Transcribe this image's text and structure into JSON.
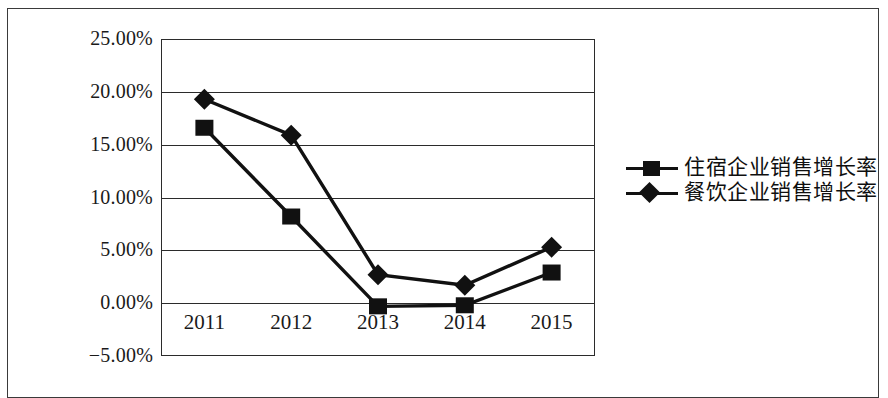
{
  "chart_data": {
    "type": "line",
    "title": "",
    "subtitle": "",
    "xlabel": "",
    "ylabel": "",
    "categories": [
      "2011",
      "2012",
      "2013",
      "2014",
      "2015"
    ],
    "ylim": [
      -5,
      25
    ],
    "yticks": [
      25,
      20,
      15,
      10,
      5,
      0,
      -5
    ],
    "ytick_labels": [
      "25.00%",
      "20.00%",
      "15.00%",
      "10.00%",
      "5.00%",
      "0.00%",
      "-5.00%"
    ],
    "grid": true,
    "legend_position": "right",
    "series": [
      {
        "name": "住宿企业销售增长率",
        "marker": "square",
        "color": "#111111",
        "values": [
          16.6,
          8.2,
          -0.3,
          -0.2,
          2.9
        ]
      },
      {
        "name": "餐饮企业销售增长率",
        "marker": "diamond",
        "color": "#111111",
        "values": [
          19.3,
          15.9,
          2.7,
          1.7,
          5.3
        ]
      }
    ]
  },
  "legend": {
    "items": [
      {
        "label": "住宿企业销售增长率",
        "marker": "square"
      },
      {
        "label": "餐饮企业销售增长率",
        "marker": "diamond"
      }
    ]
  }
}
